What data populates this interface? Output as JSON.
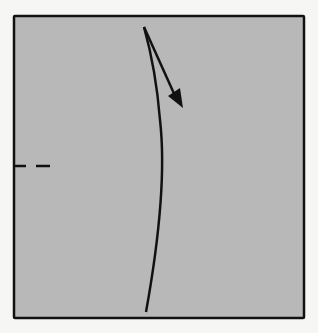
{
  "diagram": {
    "type": "origami-step",
    "paper": {
      "color": "#b8b8b8",
      "border_color": "#111111",
      "x": 14,
      "y": 16,
      "width": 290,
      "height": 302
    },
    "background": "#f6f6f4",
    "elements": [
      {
        "kind": "fold-line-curved",
        "description": "curved crease line from top to bottom"
      },
      {
        "kind": "arrow",
        "description": "fold direction arrow pointing down-right"
      },
      {
        "kind": "valley-fold-mark",
        "description": "dashed line on left edge"
      }
    ]
  }
}
